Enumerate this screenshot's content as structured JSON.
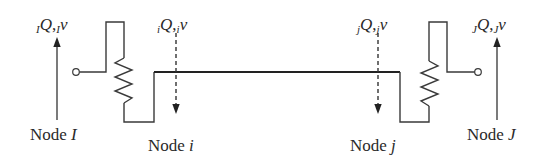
{
  "diagram": {
    "type": "two-terminal beam / line element with end springs",
    "labels": {
      "node_I": {
        "prefix": "Node ",
        "id": "I"
      },
      "node_i": {
        "prefix": "Node ",
        "id": "i"
      },
      "node_j": {
        "prefix": "Node ",
        "id": "j"
      },
      "node_J": {
        "prefix": "Node ",
        "id": "J"
      }
    },
    "forces": {
      "I": {
        "pre_sub": "I",
        "symbol": "Q",
        "comma": ",",
        "post_sub": "I",
        "tail": "v",
        "arrow": "solid-up"
      },
      "i": {
        "pre_sub": "i",
        "symbol": "Q",
        "comma": ",",
        "post_sub": "i",
        "tail": "v",
        "arrow": "dashed-down"
      },
      "j": {
        "pre_sub": "j",
        "symbol": "Q",
        "comma": ",",
        "post_sub": "j",
        "tail": "v",
        "arrow": "dashed-down"
      },
      "J": {
        "pre_sub": "J",
        "symbol": "Q",
        "comma": ",",
        "post_sub": "J",
        "tail": "v",
        "arrow": "solid-up"
      }
    },
    "colors": {
      "line": "#3a3a3a",
      "beam": "#222222",
      "text": "#2a2a2a",
      "background": "#ffffff"
    }
  }
}
